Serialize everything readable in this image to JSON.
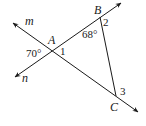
{
  "diagram": {
    "type": "geometry",
    "lines": [
      {
        "name": "m",
        "label": "m"
      },
      {
        "name": "n",
        "label": "n"
      }
    ],
    "points": [
      {
        "name": "A",
        "label": "A"
      },
      {
        "name": "B",
        "label": "B"
      },
      {
        "name": "C",
        "label": "C"
      }
    ],
    "angles": [
      {
        "id": "angle-70",
        "label": "70°"
      },
      {
        "id": "angle-68",
        "label": "68°"
      },
      {
        "id": "angle-1",
        "label": "1"
      },
      {
        "id": "angle-2",
        "label": "2"
      },
      {
        "id": "angle-3",
        "label": "3"
      }
    ],
    "stroke_color": "#1a1a1a"
  }
}
